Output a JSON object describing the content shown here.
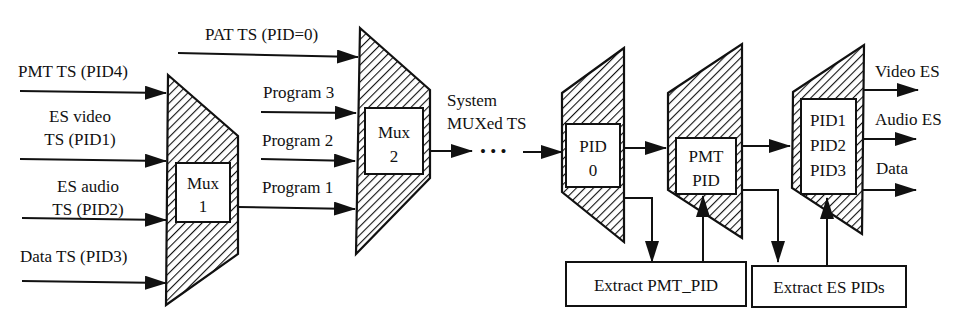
{
  "diagram": {
    "mux1": {
      "label_line1": "Mux",
      "label_line2": "1",
      "inputs": [
        {
          "line1": "PMT TS (PID4)",
          "line2": ""
        },
        {
          "line1": "ES video",
          "line2": "TS (PID1)"
        },
        {
          "line1": "ES audio",
          "line2": "TS (PID2)"
        },
        {
          "line1": "Data TS (PID3)",
          "line2": ""
        }
      ]
    },
    "mux2": {
      "label_line1": "Mux",
      "label_line2": "2",
      "inputs": [
        {
          "label": "PAT TS (PID=0)"
        },
        {
          "label": "Program 3"
        },
        {
          "label": "Program 2"
        },
        {
          "label": "Program 1"
        }
      ]
    },
    "stream": {
      "line1": "System",
      "line2": "MUXed TS",
      "ellipsis": "• • •"
    },
    "demux_pid0": {
      "line1": "PID",
      "line2": "0"
    },
    "demux_pmt": {
      "line1": "PMT",
      "line2": "PID"
    },
    "demux_es": {
      "line1": "PID1",
      "line2": "PID2",
      "line3": "PID3"
    },
    "outputs": [
      {
        "label": "Video ES"
      },
      {
        "label": "Audio ES"
      },
      {
        "label": "Data"
      }
    ],
    "extract_pmt": {
      "label": "Extract PMT_PID"
    },
    "extract_es": {
      "label": "Extract ES PIDs"
    },
    "colors": {
      "ink": "#111111",
      "background": "#ffffff"
    }
  }
}
